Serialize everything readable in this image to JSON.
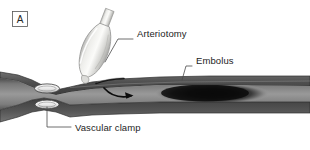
{
  "figure": {
    "panel_label": "A",
    "background_color": "#ffffff",
    "width": 310,
    "height": 150
  },
  "labels": [
    {
      "id": "arteriotomy",
      "text": "Arteriotomy",
      "x": 137,
      "y": 34,
      "leader": "M 105,62 L 118,39 L 133,39"
    },
    {
      "id": "embolus",
      "text": "Embolus",
      "x": 196,
      "y": 61,
      "leader": "M 182,80 L 186,66 L 192,66"
    },
    {
      "id": "vascular-clamp",
      "text": "Vascular clamp",
      "x": 75,
      "y": 131,
      "leader": "M 47,107 L 47,127 L 71,127"
    }
  ],
  "anatomy": {
    "vessel_name": "artery",
    "vessel_wall_color": "#5a5a5a",
    "vessel_lumen_color": "#8d8d8d",
    "vessel_outline_color": "#3a3a3a",
    "embolus_color": "#121212",
    "clamp_ring_color": "#f2f2f2",
    "clamp_ring_outline": "#4a4a4a",
    "catheter_name": "balloon-catheter",
    "catheter_color": "#e8e8e6",
    "catheter_outline": "#9a9a98",
    "flow_arrow_color": "#0d0d0d",
    "flow_arrow_direction": "right"
  }
}
